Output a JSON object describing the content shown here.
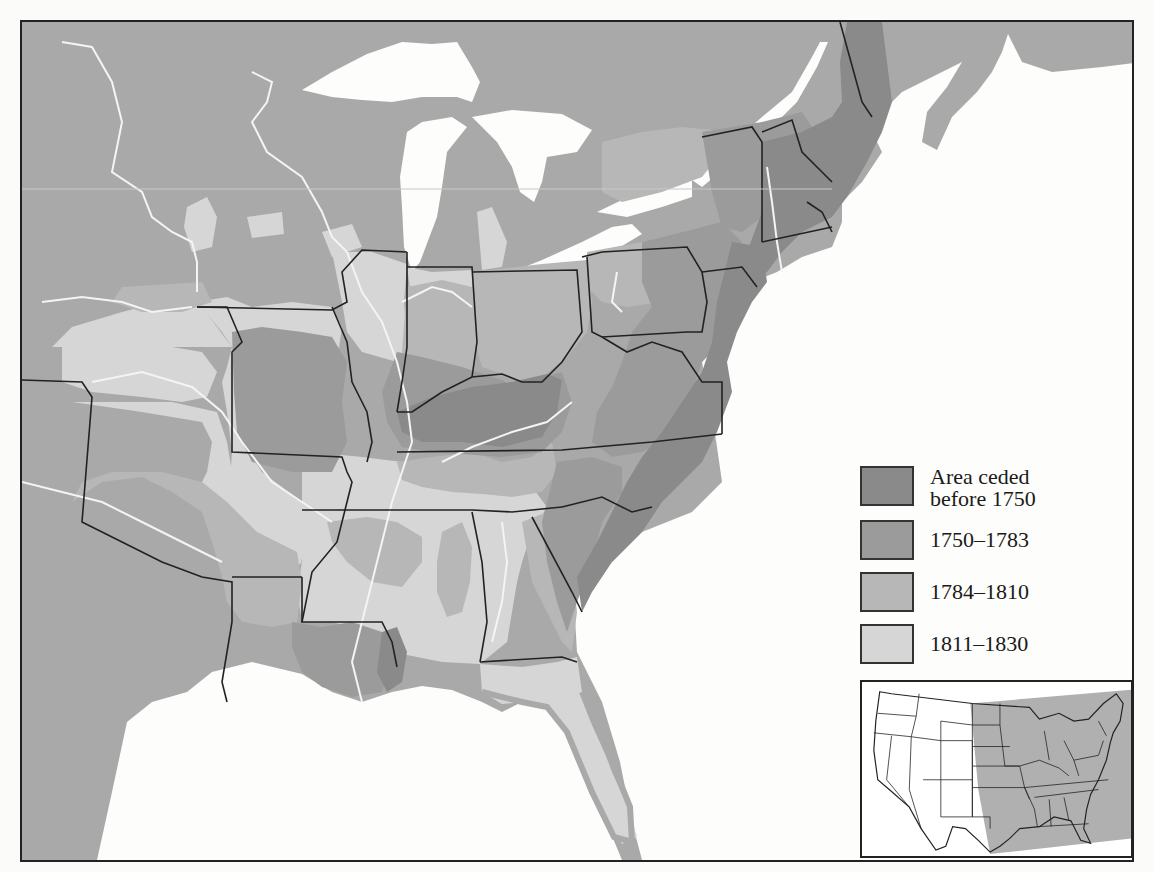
{
  "map": {
    "subject": "Eastern United States land cessions by period",
    "colors": {
      "unceded_land": "#a9a9a9",
      "before_1750": "#8a8a8a",
      "y1750_1783": "#9b9b9b",
      "y1784_1810": "#b7b7b7",
      "y1811_1830": "#d6d6d6",
      "water": "#fdfdfc",
      "borders": "#222222",
      "rivers": "#f4f4f4"
    }
  },
  "legend": {
    "items": [
      {
        "label": "Area ceded\nbefore 1750",
        "color": "#8a8a8a"
      },
      {
        "label": "1750–1783",
        "color": "#9b9b9b"
      },
      {
        "label": "1784–1810",
        "color": "#b7b7b7"
      },
      {
        "label": "1811–1830",
        "color": "#d6d6d6"
      }
    ]
  },
  "inset": {
    "description": "Locator map of the contiguous United States with eastern region highlighted",
    "highlight_color": "#b0b0b0"
  }
}
